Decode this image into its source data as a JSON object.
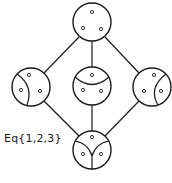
{
  "diagram": {
    "label": "Eq{1,2,3}",
    "colors": {
      "stroke": "#1a1a1a",
      "background": "#ffffff"
    },
    "nodes": [
      {
        "id": "top",
        "description": "discrete partition: three separate blocks",
        "blocks": 3
      },
      {
        "id": "left",
        "description": "partition with one point separated on the left",
        "blocks": 2
      },
      {
        "id": "middle",
        "description": "partition with top point separated",
        "blocks": 2
      },
      {
        "id": "right",
        "description": "partition with one point separated on the right",
        "blocks": 2
      },
      {
        "id": "bottom",
        "description": "partition into three sectors (Y divider)",
        "blocks": 3
      }
    ],
    "edges": [
      [
        "top",
        "left"
      ],
      [
        "top",
        "middle"
      ],
      [
        "top",
        "right"
      ],
      [
        "left",
        "bottom"
      ],
      [
        "middle",
        "bottom"
      ],
      [
        "right",
        "bottom"
      ]
    ]
  }
}
